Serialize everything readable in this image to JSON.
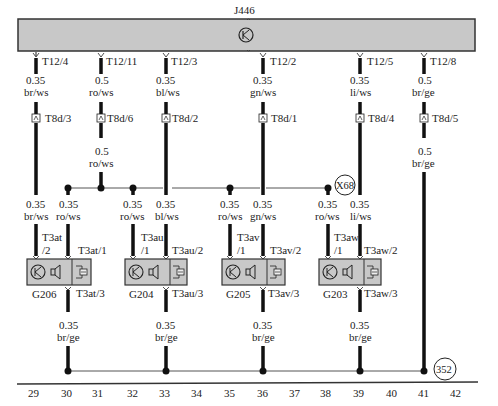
{
  "diagram": {
    "control_unit": {
      "id": "J446",
      "symbol": "transistor-icon"
    },
    "ecu_pins": [
      {
        "pin": "T12/4",
        "x": 36,
        "gauge": "0.35",
        "color": "br/ws"
      },
      {
        "pin": "T12/11",
        "x": 101,
        "gauge": "0.5",
        "color": "ro/ws"
      },
      {
        "pin": "T12/3",
        "x": 166,
        "gauge": "0.35",
        "color": "bl/ws"
      },
      {
        "pin": "T12/2",
        "x": 263,
        "gauge": "0.35",
        "color": "gn/ws"
      },
      {
        "pin": "T12/5",
        "x": 360,
        "gauge": "0.35",
        "color": "li/ws"
      },
      {
        "pin": "T12/8",
        "x": 424,
        "gauge": "0.5",
        "color": "br/ge"
      }
    ],
    "connectors_t8d": [
      "T8d/3",
      "T8d/6",
      "T8d/2",
      "T8d/1",
      "T8d/4",
      "T8d/5"
    ],
    "mid_wires": {
      "ro_ws_feed": {
        "gauge": "0.5",
        "color": "ro/ws"
      },
      "gnd_feed": {
        "gauge": "0.5",
        "color": "br/ge"
      }
    },
    "splice_label": "X68",
    "ground_label": "352",
    "sensors": [
      {
        "id": "G206",
        "conn_left": "T3at\n/2",
        "conn_left_a": "T3at",
        "conn_left_b": "/2",
        "conn_right": "T3at/1",
        "conn_bottom": "T3at/3",
        "left_wire": {
          "gauge": "0.35",
          "color": "br/ws"
        },
        "right_wire": {
          "gauge": "0.35",
          "color": "ro/ws"
        },
        "ground_wire": {
          "gauge": "0.35",
          "color": "br/ge"
        }
      },
      {
        "id": "G204",
        "conn_left_a": "T3au",
        "conn_left_b": "/1",
        "conn_right": "T3au/2",
        "conn_bottom": "T3au/3",
        "left_wire": {
          "gauge": "0.35",
          "color": "ro/ws"
        },
        "right_wire": {
          "gauge": "0.35",
          "color": "bl/ws"
        },
        "ground_wire": {
          "gauge": "0.35",
          "color": "br/ge"
        }
      },
      {
        "id": "G205",
        "conn_left_a": "T3av",
        "conn_left_b": "/1",
        "conn_right": "T3av/2",
        "conn_bottom": "T3av/3",
        "left_wire": {
          "gauge": "0.35",
          "color": "ro/ws"
        },
        "right_wire": {
          "gauge": "0.35",
          "color": "gn/ws"
        },
        "ground_wire": {
          "gauge": "0.35",
          "color": "br/ge"
        }
      },
      {
        "id": "G203",
        "conn_left_a": "T3aw",
        "conn_left_b": "/1",
        "conn_right": "T3aw/2",
        "conn_bottom": "T3aw/3",
        "left_wire": {
          "gauge": "0.35",
          "color": "ro/ws"
        },
        "right_wire": {
          "gauge": "0.35",
          "color": "li/ws"
        },
        "ground_wire": {
          "gauge": "0.35",
          "color": "br/ge"
        }
      }
    ],
    "grid_numbers": [
      "29",
      "30",
      "31",
      "32",
      "33",
      "34",
      "35",
      "36",
      "37",
      "38",
      "39",
      "40",
      "41",
      "42"
    ],
    "colors": {
      "ecu_fill": "#c8c8c8",
      "box_fill": "#c8c8c8",
      "wire": "#111111",
      "thin_wire": "#555555"
    }
  }
}
